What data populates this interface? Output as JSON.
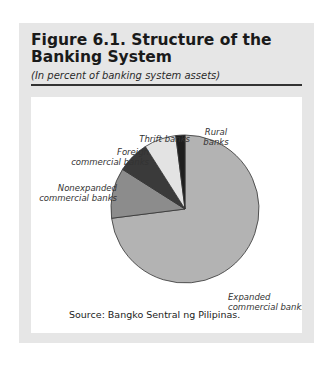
{
  "figure": {
    "title": "Figure 6.1.  Structure of the Banking System",
    "subtitle": "(In percent of banking system assets)",
    "source": "Source:  Bangko Sentral ng Pilipinas."
  },
  "chart_data": {
    "type": "pie",
    "title": "Structure of the Banking System",
    "subtitle": "In percent of banking system assets",
    "categories": [
      "Expanded commercial banks",
      "Nonexpanded commercial banks",
      "Foreign commercial banks",
      "Thrift banks",
      "Rural banks"
    ],
    "values": [
      73,
      11,
      7,
      7,
      2
    ],
    "colors": [
      "#b3b3b3",
      "#8c8c8c",
      "#3a3a3a",
      "#e3e3e3",
      "#1e1e1e"
    ],
    "start_angle_deg": 0,
    "direction": "clockwise",
    "legend": "direct labels"
  },
  "labels": {
    "expanded_1": "Expanded",
    "expanded_2": "commercial banks",
    "nonexpanded_1": "Nonexpanded",
    "nonexpanded_2": "commercial banks",
    "foreign_1": "Foreign",
    "foreign_2": "commercial banks",
    "thrift": "Thrift banks",
    "rural_1": "Rural",
    "rural_2": "banks"
  }
}
